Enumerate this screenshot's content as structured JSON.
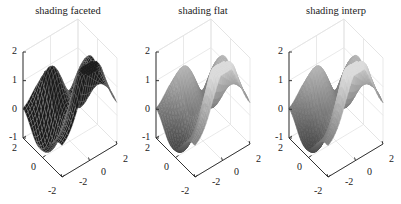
{
  "chart_data": [
    {
      "type": "surface",
      "title": "shading faceted",
      "shading": "faceted",
      "function": "peaks",
      "xlim": [
        -2,
        2
      ],
      "ylim": [
        -2,
        2
      ],
      "zlim": [
        -1,
        2
      ],
      "xticks": [
        -2,
        0,
        2
      ],
      "yticks": [
        -2,
        0,
        2
      ],
      "zticks": [
        -1,
        0,
        1,
        2
      ],
      "grid": true,
      "colormap": "gray"
    },
    {
      "type": "surface",
      "title": "shading flat",
      "shading": "flat",
      "function": "peaks",
      "xlim": [
        -2,
        2
      ],
      "ylim": [
        -2,
        2
      ],
      "zlim": [
        -1,
        2
      ],
      "xticks": [
        -2,
        0,
        2
      ],
      "yticks": [
        -2,
        0,
        2
      ],
      "zticks": [
        -1,
        0,
        1,
        2
      ],
      "grid": true,
      "colormap": "gray"
    },
    {
      "type": "surface",
      "title": "shading interp",
      "shading": "interp",
      "function": "peaks",
      "xlim": [
        -2,
        2
      ],
      "ylim": [
        -2,
        2
      ],
      "zlim": [
        -1,
        2
      ],
      "xticks": [
        -2,
        0,
        2
      ],
      "yticks": [
        -2,
        0,
        2
      ],
      "zticks": [
        -1,
        0,
        1,
        2
      ],
      "grid": true,
      "colormap": "gray"
    }
  ],
  "panels": [
    {
      "title": "shading faceted",
      "left": 0,
      "z_labels": [
        "2",
        "1",
        "0",
        "-1"
      ],
      "y_labels": [
        "2",
        "0",
        "-2"
      ],
      "x_labels": [
        "-2",
        "0",
        "2"
      ]
    },
    {
      "title": "shading flat",
      "left": 133,
      "z_labels": [
        "2",
        "1",
        "0",
        "-1"
      ],
      "y_labels": [
        "2",
        "0",
        "-2"
      ],
      "x_labels": [
        "-2",
        "0",
        "2"
      ]
    },
    {
      "title": "shading interp",
      "left": 266,
      "z_labels": [
        "2",
        "1",
        "0",
        "-1"
      ],
      "y_labels": [
        "2",
        "0",
        "-2"
      ],
      "x_labels": [
        "-2",
        "0",
        "2"
      ]
    }
  ],
  "colors": {
    "axis": "#333333",
    "grid": "#e3e3e3",
    "faceted_fill": "#1a1a1a",
    "faceted_edge": "#9a9a9a"
  }
}
